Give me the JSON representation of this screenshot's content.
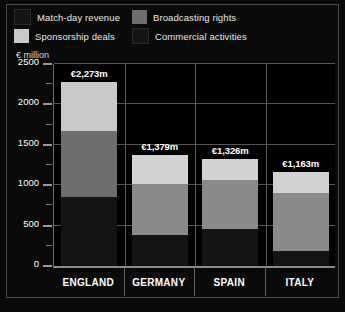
{
  "legend": {
    "items": [
      {
        "label": "Match-day revenue",
        "color": "#141414",
        "swatch_name": "legend-swatch-match-day"
      },
      {
        "label": "Broadcasting rights",
        "color": "#6e6e6e",
        "swatch_name": "legend-swatch-broadcasting"
      },
      {
        "label": "Sponsorship deals",
        "color": "#c9c9c9",
        "swatch_name": "legend-swatch-sponsorship"
      },
      {
        "label": "Commercial activities",
        "color": "#141414",
        "swatch_name": "legend-swatch-commercial"
      }
    ]
  },
  "axis": {
    "unit_label": "€ million",
    "y_ticks": [
      "2500",
      "2000",
      "1500",
      "1000",
      "500",
      "0"
    ]
  },
  "bars": [
    {
      "category": "ENGLAND",
      "total_label": "€2,273m",
      "segments": [
        {
          "name": "Match-day revenue",
          "value": 850,
          "color": "#141414"
        },
        {
          "name": "Broadcasting rights",
          "value": 820,
          "color": "#6e6e6e"
        },
        {
          "name": "Sponsorship deals",
          "value": 603,
          "color": "#c9c9c9"
        }
      ]
    },
    {
      "category": "GERMANY",
      "total_label": "€1,379m",
      "segments": [
        {
          "name": "Match-day revenue",
          "value": 390,
          "color": "#141414"
        },
        {
          "name": "Broadcasting rights",
          "value": 620,
          "color": "#8a8a8a"
        },
        {
          "name": "Sponsorship deals",
          "value": 369,
          "color": "#d2d2d2"
        }
      ]
    },
    {
      "category": "SPAIN",
      "total_label": "€1,326m",
      "segments": [
        {
          "name": "Match-day revenue",
          "value": 460,
          "color": "#141414"
        },
        {
          "name": "Broadcasting rights",
          "value": 610,
          "color": "#8a8a8a"
        },
        {
          "name": "Sponsorship deals",
          "value": 256,
          "color": "#d2d2d2"
        }
      ]
    },
    {
      "category": "ITALY",
      "total_label": "€1,163m",
      "segments": [
        {
          "name": "Match-day revenue",
          "value": 180,
          "color": "#141414"
        },
        {
          "name": "Broadcasting rights",
          "value": 728,
          "color": "#8a8a8a"
        },
        {
          "name": "Sponsorship deals",
          "value": 255,
          "color": "#d2d2d2"
        }
      ]
    }
  ],
  "chart_data": {
    "type": "bar",
    "subtype": "stacked-vertical",
    "title": "",
    "subtitle": "",
    "xlabel": "",
    "ylabel": "€ million",
    "ylim": [
      0,
      2500
    ],
    "ytick_values": [
      0,
      500,
      1000,
      1500,
      2000,
      2500
    ],
    "ytick_labels": [
      "0",
      "500",
      "1000",
      "1500",
      "2000",
      "2500"
    ],
    "minor_ticks": [
      250,
      750,
      1250,
      1750,
      2250
    ],
    "grid": "horizontal",
    "legend_position": "top",
    "categories": [
      "ENGLAND",
      "GERMANY",
      "SPAIN",
      "ITALY"
    ],
    "series": [
      {
        "name": "Match-day revenue",
        "color": "#141414",
        "values": [
          850,
          390,
          460,
          180
        ]
      },
      {
        "name": "Broadcasting rights",
        "color": "#6e6e6e",
        "values": [
          820,
          620,
          610,
          728
        ]
      },
      {
        "name": "Sponsorship deals",
        "color": "#c9c9c9",
        "values": [
          603,
          369,
          256,
          255
        ]
      },
      {
        "name": "Commercial activities",
        "color": "#141414",
        "values": [
          0,
          0,
          0,
          0
        ]
      }
    ],
    "totals": [
      2273,
      1379,
      1326,
      1163
    ],
    "total_labels": [
      "€2,273m",
      "€1,379m",
      "€1,326m",
      "€1,163m"
    ],
    "annotations": [
      {
        "category": "ENGLAND",
        "text": "€2,273m",
        "position": "above-bar"
      },
      {
        "category": "GERMANY",
        "text": "€1,379m",
        "position": "above-bar"
      },
      {
        "category": "SPAIN",
        "text": "€1,326m",
        "position": "above-bar"
      },
      {
        "category": "ITALY",
        "text": "€1,163m",
        "position": "above-bar"
      }
    ],
    "background_color": "#000000",
    "text_color": "#ffffff"
  }
}
